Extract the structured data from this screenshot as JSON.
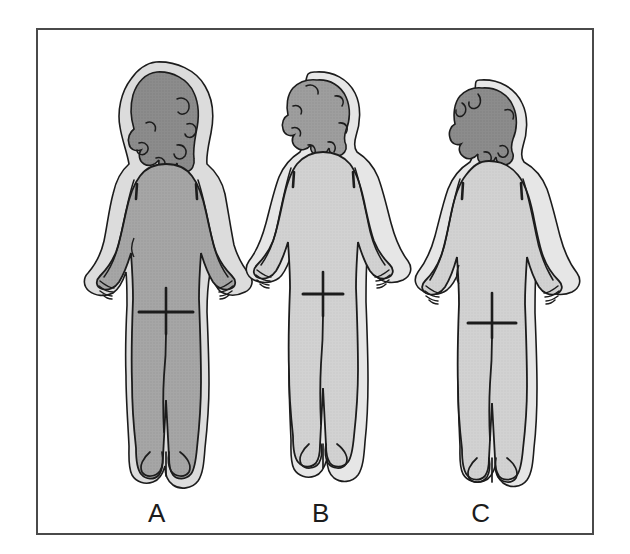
{
  "figure": {
    "view": "posterior",
    "frame_border_color": "#4a4a4a",
    "background_color": "#ffffff",
    "outline_color": "#1c1c1c"
  },
  "labels": {
    "a": "A",
    "b": "B",
    "c": "C"
  },
  "subjects": [
    {
      "id": "a",
      "label": "A",
      "position": "left",
      "hair_style": "long-wavy",
      "hair_color": "#8c8c8c",
      "body_color": "#a6a6a6",
      "halo_color": "#dcdcdc",
      "build": "fuller",
      "markings": [
        "gluteal-cleft",
        "gluteal-fold",
        "spine-line",
        "scapula-lines"
      ]
    },
    {
      "id": "b",
      "label": "B",
      "position": "center",
      "hair_style": "short-curly",
      "hair_color": "#9e9e9e",
      "body_color": "#d2d2d2",
      "halo_color": "#e6e6e6",
      "build": "slender",
      "markings": [
        "gluteal-cleft",
        "gluteal-fold",
        "spine-line",
        "scapula-lines"
      ]
    },
    {
      "id": "c",
      "label": "C",
      "position": "right",
      "hair_style": "short-curly",
      "hair_color": "#8c8c8c",
      "body_color": "#d2d2d2",
      "halo_color": "#e6e6e6",
      "build": "medium",
      "markings": [
        "gluteal-cleft",
        "gluteal-fold",
        "spine-line",
        "scapula-lines"
      ]
    }
  ],
  "colors": {
    "hair_dark": "#8c8c8c",
    "hair_medium": "#9e9e9e",
    "body_dark": "#a6a6a6",
    "body_light": "#d2d2d2",
    "halo_light": "#dcdcdc",
    "halo_lighter": "#e6e6e6",
    "stroke": "#1c1c1c",
    "frame": "#4a4a4a"
  }
}
